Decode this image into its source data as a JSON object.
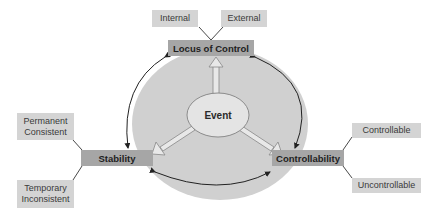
{
  "diagram": {
    "center": {
      "label": "Event"
    },
    "dimensions": [
      {
        "id": "locus",
        "label": "Locus of Control",
        "options": [
          "Internal",
          "External"
        ]
      },
      {
        "id": "stability",
        "label": "Stability",
        "options": [
          "Permanent\nConsistent",
          "Temporary\nInconsistent"
        ]
      },
      {
        "id": "controllability",
        "label": "Controllability",
        "options": [
          "Controllable",
          "Uncontrollable"
        ]
      }
    ],
    "colors": {
      "outer_ellipse": "#d0d0d0",
      "inner_ellipse": "#e4e4e4",
      "dimension_box": "#a6a6a6",
      "option_box": "#d4d4d4",
      "lines": "#333333"
    }
  }
}
